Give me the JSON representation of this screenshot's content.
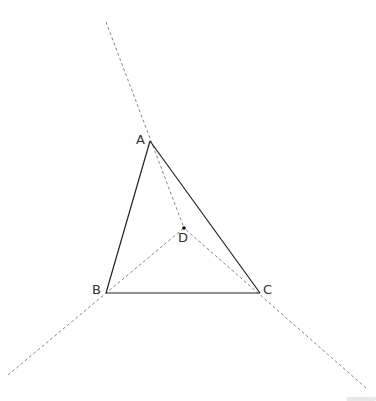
{
  "diagram": {
    "title": "",
    "points": {
      "A": {
        "label": "A"
      },
      "B": {
        "label": "B"
      },
      "C": {
        "label": "C"
      },
      "D": {
        "label": "D"
      }
    },
    "segments": [
      {
        "from": "A",
        "to": "B",
        "style": "solid"
      },
      {
        "from": "B",
        "to": "C",
        "style": "solid"
      },
      {
        "from": "C",
        "to": "A",
        "style": "solid"
      }
    ],
    "dashed_lines": [
      {
        "through": [
          "A",
          "D"
        ],
        "description": "line AD extended"
      },
      {
        "through": [
          "B",
          "D"
        ],
        "description": "line BD extended"
      },
      {
        "through": [
          "C",
          "D"
        ],
        "description": "line CD extended"
      }
    ],
    "marked_point": "D",
    "colors": {
      "stroke": "#222222",
      "dashed": "#666666",
      "label": "#333333"
    }
  }
}
